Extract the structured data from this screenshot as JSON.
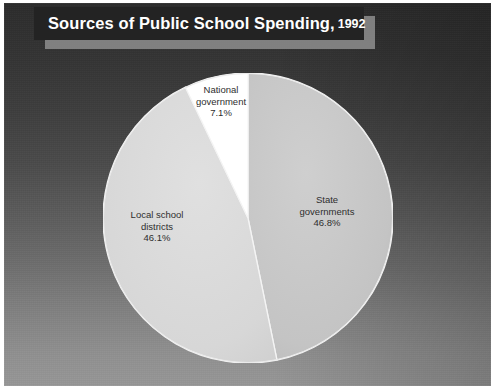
{
  "title": {
    "main": "Sources of Public School Spending,",
    "year": "1992"
  },
  "colors": {
    "banner_bg": "#232323",
    "banner_shadow": "#8e8e8e",
    "state_slice": "#c3c3c3",
    "local_slice": "#d8d8d8",
    "national_slice": "#ffffff",
    "slice_outline": "#f2f2f2",
    "label_text": "#2e2e2e",
    "background_top": "#2b2b2b",
    "background_bottom": "#969696"
  },
  "labels": {
    "state": {
      "line1": "State",
      "line2": "governments",
      "pct": "46.8%"
    },
    "local": {
      "line1": "Local school",
      "line2": "districts",
      "pct": "46.1%"
    },
    "national": {
      "line1": "National",
      "line2": "government",
      "pct": "7.1%"
    }
  },
  "chart_data": {
    "type": "pie",
    "title": "Sources of Public School Spending, 1992",
    "subtitle": "",
    "xlabel": "",
    "ylabel": "",
    "legend": "none",
    "grid": false,
    "start_angle_deg": 0,
    "direction": "clockwise",
    "units": "percent",
    "total": 100.0,
    "categories": [
      "State governments",
      "Local school districts",
      "National government"
    ],
    "values": [
      46.8,
      46.1,
      7.1
    ],
    "slice_colors": [
      "#c3c3c3",
      "#d8d8d8",
      "#ffffff"
    ],
    "labels": [
      "State governments 46.8%",
      "Local school districts 46.1%",
      "National government 7.1%"
    ],
    "slices": [
      {
        "name": "State governments",
        "value": 46.8,
        "label": "State governments 46.8%",
        "color": "#c3c3c3",
        "start_deg": 0.0,
        "end_deg": 168.48
      },
      {
        "name": "Local school districts",
        "value": 46.1,
        "label": "Local school districts 46.1%",
        "color": "#d8d8d8",
        "start_deg": 168.48,
        "end_deg": 334.44
      },
      {
        "name": "National government",
        "value": 7.1,
        "label": "National government 7.1%",
        "color": "#ffffff",
        "start_deg": 334.44,
        "end_deg": 360.0
      }
    ]
  }
}
